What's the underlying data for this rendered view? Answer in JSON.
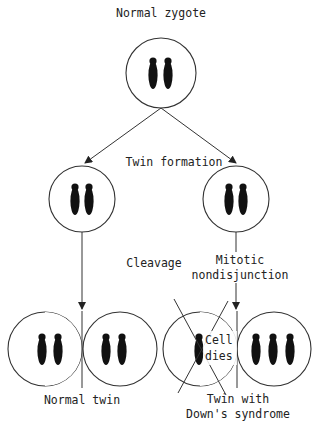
{
  "diagram": {
    "title": "Normal zygote",
    "labels": {
      "zygote": "Normal zygote",
      "twin_formation": "Twin formation",
      "cleavage": "Cleavage",
      "mitotic_line1": "Mitotic",
      "mitotic_line2": "nondisjunction",
      "cell_dies_line1": "Cell",
      "cell_dies_line2": "dies",
      "normal_twin": "Normal twin",
      "down_line1": "Twin with",
      "down_line2": "Down's syndrome"
    },
    "nodes": [
      {
        "id": "zygote",
        "chromosomes": 2
      },
      {
        "id": "left-twin-cell",
        "chromosomes": 2
      },
      {
        "id": "right-twin-cell",
        "chromosomes": 2
      },
      {
        "id": "normal-twin-left-cell",
        "chromosomes": 2
      },
      {
        "id": "normal-twin-right-cell",
        "chromosomes": 2
      },
      {
        "id": "down-twin-dead-cell",
        "chromosomes": 1,
        "crossed_out": true
      },
      {
        "id": "down-twin-trisomic-cell",
        "chromosomes": 3
      }
    ],
    "edges": [
      {
        "from": "zygote",
        "to": "left-twin-cell",
        "label": "Twin formation"
      },
      {
        "from": "zygote",
        "to": "right-twin-cell",
        "label": "Twin formation"
      },
      {
        "from": "left-twin-cell",
        "to": "normal-twin",
        "label": "Cleavage"
      },
      {
        "from": "right-twin-cell",
        "to": "down-twin",
        "label": "Mitotic nondisjunction"
      }
    ]
  }
}
